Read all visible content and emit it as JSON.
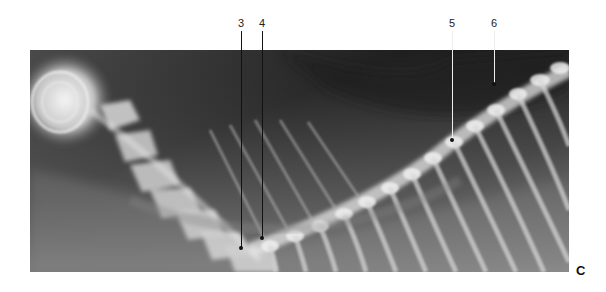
{
  "figure": {
    "panel_label": "C",
    "annotations": [
      {
        "label": "3",
        "x": 241,
        "label_y": 18,
        "line_top": 31,
        "line_bottom": 248
      },
      {
        "label": "4",
        "x": 262,
        "label_y": 18,
        "line_top": 31,
        "line_bottom": 238
      },
      {
        "label": "5",
        "x": 452,
        "label_y": 18,
        "line_top": 31,
        "line_bottom": 140
      },
      {
        "label": "6",
        "x": 494,
        "label_y": 18,
        "line_top": 31,
        "line_bottom": 84
      }
    ]
  }
}
